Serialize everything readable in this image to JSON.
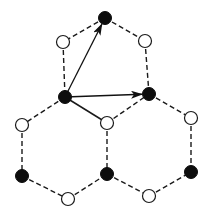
{
  "diagram": {
    "title": "",
    "colors": {
      "filled_atom": "#0d0d0d",
      "open_atom": "#ffffff",
      "bond": "#1a1a1a",
      "vector": "#111111"
    },
    "nodes": [
      {
        "id": "A_top",
        "x": 105,
        "y": 18,
        "type": "filled"
      },
      {
        "id": "B_ul",
        "x": 63,
        "y": 42,
        "type": "open"
      },
      {
        "id": "B_ur",
        "x": 145,
        "y": 41,
        "type": "open"
      },
      {
        "id": "A_center",
        "x": 65,
        "y": 97,
        "type": "filled"
      },
      {
        "id": "A_right",
        "x": 149,
        "y": 94,
        "type": "filled"
      },
      {
        "id": "B_left",
        "x": 22,
        "y": 125,
        "type": "open"
      },
      {
        "id": "B_mid",
        "x": 107,
        "y": 123,
        "type": "open"
      },
      {
        "id": "B_right",
        "x": 191,
        "y": 118,
        "type": "open"
      },
      {
        "id": "A_left",
        "x": 22,
        "y": 176,
        "type": "filled"
      },
      {
        "id": "A_mid",
        "x": 107,
        "y": 174,
        "type": "filled"
      },
      {
        "id": "A_rbot",
        "x": 191,
        "y": 172,
        "type": "filled"
      },
      {
        "id": "B_bl",
        "x": 68,
        "y": 199,
        "type": "open"
      },
      {
        "id": "B_br",
        "x": 149,
        "y": 196,
        "type": "open"
      }
    ],
    "edges": [
      {
        "from": "A_top",
        "to": "B_ul",
        "style": "dashed"
      },
      {
        "from": "A_top",
        "to": "B_ur",
        "style": "dashed"
      },
      {
        "from": "B_ul",
        "to": "A_center",
        "style": "dashed"
      },
      {
        "from": "B_ur",
        "to": "A_right",
        "style": "dashed"
      },
      {
        "from": "A_center",
        "to": "B_left",
        "style": "dashed"
      },
      {
        "from": "A_center",
        "to": "B_mid",
        "style": "solid"
      },
      {
        "from": "B_mid",
        "to": "A_right",
        "style": "dashed"
      },
      {
        "from": "A_right",
        "to": "B_right",
        "style": "dashed"
      },
      {
        "from": "B_left",
        "to": "A_left",
        "style": "dashed"
      },
      {
        "from": "B_mid",
        "to": "A_mid",
        "style": "dashed"
      },
      {
        "from": "B_right",
        "to": "A_rbot",
        "style": "dashed"
      },
      {
        "from": "A_left",
        "to": "B_bl",
        "style": "dashed"
      },
      {
        "from": "B_bl",
        "to": "A_mid",
        "style": "dashed"
      },
      {
        "from": "A_mid",
        "to": "B_br",
        "style": "dashed"
      },
      {
        "from": "B_br",
        "to": "A_rbot",
        "style": "dashed"
      }
    ],
    "vectors": [
      {
        "id": "a1",
        "from": "A_center",
        "to": "A_top"
      },
      {
        "id": "a2",
        "from": "A_center",
        "to": "A_right"
      }
    ],
    "node_radius": 6.5
  }
}
